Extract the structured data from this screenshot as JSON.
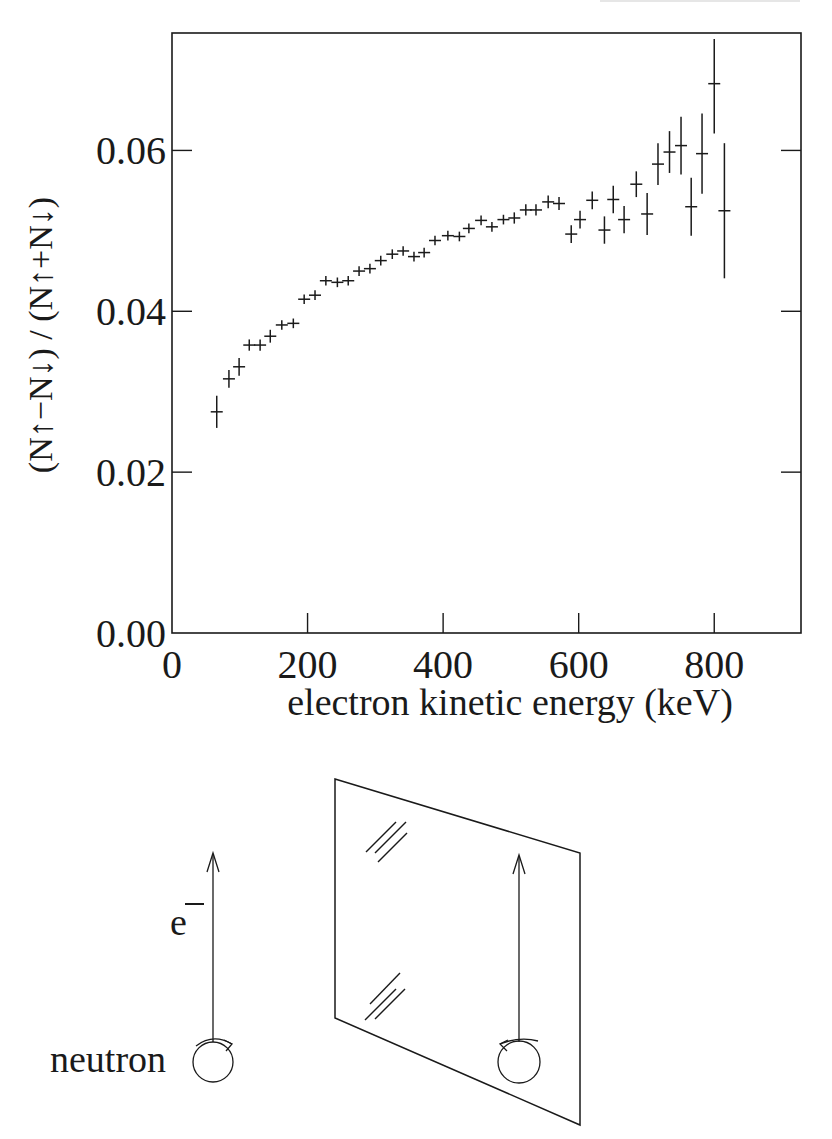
{
  "chart_data": {
    "type": "scatter",
    "title": "",
    "xlabel": "electron kinetic energy (keV)",
    "ylabel": "(N↑−N↓) / (N↑+N↓)",
    "xlim": [
      0,
      928
    ],
    "ylim": [
      0.0,
      0.0746
    ],
    "xticks": [
      0,
      200,
      400,
      600,
      800
    ],
    "xtick_labels": [
      "0",
      "200",
      "400",
      "600",
      "800"
    ],
    "yticks": [
      0.0,
      0.02,
      0.04,
      0.06
    ],
    "ytick_labels": [
      "0.00",
      "0.02",
      "0.04",
      "0.06"
    ],
    "grid": false,
    "legend": null,
    "marker": "cross with vertical error bar",
    "series": [
      {
        "name": "beta asymmetry",
        "x": [
          66,
          84,
          99,
          114,
          130,
          145,
          162,
          179,
          195,
          211,
          227,
          244,
          260,
          276,
          292,
          308,
          325,
          341,
          357,
          372,
          388,
          407,
          424,
          438,
          456,
          472,
          489,
          505,
          522,
          537,
          555,
          571,
          589,
          602,
          620,
          638,
          651,
          667,
          685,
          701,
          717,
          734,
          751,
          766,
          782,
          800,
          815
        ],
        "y": [
          0.0275,
          0.0316,
          0.0331,
          0.0358,
          0.0358,
          0.0369,
          0.0383,
          0.0385,
          0.0415,
          0.042,
          0.0438,
          0.0436,
          0.0438,
          0.045,
          0.0453,
          0.0463,
          0.0471,
          0.0475,
          0.0468,
          0.0473,
          0.0488,
          0.0494,
          0.0493,
          0.0503,
          0.0513,
          0.0505,
          0.0514,
          0.0516,
          0.0526,
          0.0526,
          0.0536,
          0.0534,
          0.0496,
          0.0514,
          0.0538,
          0.0501,
          0.0539,
          0.0514,
          0.0558,
          0.0521,
          0.0583,
          0.0598,
          0.0606,
          0.053,
          0.0596,
          0.0683,
          0.0525
        ],
        "yerr": [
          0.002,
          0.0011,
          0.0011,
          0.0007,
          0.0007,
          0.0008,
          0.0006,
          0.0006,
          0.0006,
          0.0006,
          0.0006,
          0.0006,
          0.0006,
          0.0006,
          0.0006,
          0.0006,
          0.0006,
          0.0006,
          0.0006,
          0.0006,
          0.0006,
          0.0006,
          0.0006,
          0.0006,
          0.0006,
          0.0006,
          0.0006,
          0.0007,
          0.0007,
          0.0007,
          0.0008,
          0.0008,
          0.0011,
          0.0011,
          0.0011,
          0.0017,
          0.0017,
          0.0017,
          0.0016,
          0.0026,
          0.0026,
          0.0026,
          0.0036,
          0.0036,
          0.005,
          0.0062,
          0.0084
        ]
      }
    ]
  },
  "diagram": {
    "electron_label": "e",
    "electron_charge": "−",
    "neutron_label": "neutron"
  },
  "colors": {
    "ink": "#1a1a1a",
    "background": "#ffffff"
  }
}
